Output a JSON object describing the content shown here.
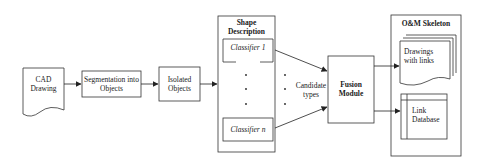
{
  "diagram": {
    "nodes": {
      "cad_drawing": {
        "line1": "CAD",
        "line2": "Drawing"
      },
      "segmentation": {
        "line1": "Segmentation into",
        "line2": "Objects"
      },
      "isolated_objects": {
        "line1": "Isolated",
        "line2": "Objects"
      },
      "shape_description": {
        "title_line1": "Shape",
        "title_line2": "Description",
        "classifier_first": "Classifier 1",
        "classifier_last": "Classifier n"
      },
      "candidate_types": {
        "line1": "Candidate",
        "line2": "types"
      },
      "fusion_module": {
        "line1": "Fusion",
        "line2": "Module"
      },
      "om_skeleton": {
        "title": "O&M Skeleton",
        "drawings": {
          "line1": "Drawings",
          "line2": "with links"
        },
        "link_database": {
          "line1": "Link",
          "line2": "Database"
        }
      }
    },
    "edges": [
      {
        "from": "CAD Drawing",
        "to": "Segmentation into Objects"
      },
      {
        "from": "Segmentation into Objects",
        "to": "Isolated Objects"
      },
      {
        "from": "Isolated Objects",
        "to": "Shape Description"
      },
      {
        "from": "Classifier 1",
        "to": "Fusion Module"
      },
      {
        "from": "Classifier n",
        "to": "Fusion Module"
      },
      {
        "from": "Fusion Module",
        "to": "Drawings with links"
      },
      {
        "from": "Fusion Module",
        "to": "Link Database"
      }
    ],
    "colors": {
      "stroke": "#333333",
      "background": "#ffffff"
    }
  }
}
